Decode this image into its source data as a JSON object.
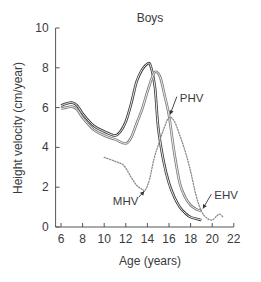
{
  "chart_data": {
    "type": "line",
    "title": "Boys",
    "xlabel": "Age (years)",
    "ylabel": "Height velocity (cm/year)",
    "xlim": [
      5.5,
      22
    ],
    "ylim": [
      0,
      10
    ],
    "x_ticks": [
      6,
      8,
      10,
      12,
      14,
      16,
      18,
      20,
      22
    ],
    "y_ticks": [
      0,
      2,
      4,
      6,
      8,
      10
    ],
    "grid": false,
    "legend": null,
    "series": [
      {
        "name": "Early maturer (dark solid)",
        "style": "solid",
        "color": "#3a3a3a",
        "points": [
          [
            6,
            6.1
          ],
          [
            6.5,
            6.2
          ],
          [
            7,
            6.25
          ],
          [
            7.5,
            6.1
          ],
          [
            8,
            5.7
          ],
          [
            9,
            5.1
          ],
          [
            10,
            4.8
          ],
          [
            11,
            4.6
          ],
          [
            11.5,
            4.8
          ],
          [
            12,
            5.3
          ],
          [
            12.5,
            6.2
          ],
          [
            13,
            7.3
          ],
          [
            13.5,
            7.9
          ],
          [
            14,
            8.2
          ],
          [
            14.3,
            8.1
          ],
          [
            14.7,
            7.0
          ],
          [
            15,
            5.0
          ],
          [
            15.5,
            3.3
          ],
          [
            16,
            2.2
          ],
          [
            16.5,
            1.5
          ],
          [
            17,
            1.0
          ],
          [
            17.5,
            0.7
          ],
          [
            18,
            0.5
          ],
          [
            19,
            0.35
          ]
        ]
      },
      {
        "name": "Late maturer (light solid)",
        "style": "solid",
        "color": "#7a7a7a",
        "points": [
          [
            6,
            5.95
          ],
          [
            6.5,
            6.0
          ],
          [
            7,
            6.05
          ],
          [
            7.5,
            5.9
          ],
          [
            8,
            5.5
          ],
          [
            9,
            4.9
          ],
          [
            10,
            4.6
          ],
          [
            11,
            4.4
          ],
          [
            12,
            4.2
          ],
          [
            12.5,
            4.5
          ],
          [
            13,
            5.2
          ],
          [
            13.5,
            5.9
          ],
          [
            14,
            6.8
          ],
          [
            14.5,
            7.6
          ],
          [
            14.8,
            7.8
          ],
          [
            15.2,
            7.5
          ],
          [
            15.6,
            6.6
          ],
          [
            16,
            5.6
          ],
          [
            16.5,
            3.7
          ],
          [
            17,
            2.2
          ],
          [
            17.5,
            1.5
          ],
          [
            18,
            1.1
          ],
          [
            18.5,
            0.9
          ],
          [
            19,
            0.8
          ]
        ]
      },
      {
        "name": "Velocity difference (dotted)",
        "style": "dotted",
        "color": "#8a8a8a",
        "points": [
          [
            10,
            3.5
          ],
          [
            11,
            3.3
          ],
          [
            11.8,
            3.1
          ],
          [
            12.5,
            2.5
          ],
          [
            13,
            2.1
          ],
          [
            13.5,
            1.9
          ],
          [
            13.8,
            1.85
          ],
          [
            14.2,
            2.4
          ],
          [
            14.6,
            3.4
          ],
          [
            15,
            4.1
          ],
          [
            15.5,
            4.9
          ],
          [
            16,
            5.5
          ],
          [
            16.5,
            5.3
          ],
          [
            17,
            4.6
          ],
          [
            17.5,
            3.8
          ],
          [
            18,
            2.8
          ],
          [
            18.5,
            1.6
          ],
          [
            19,
            0.8
          ],
          [
            19.5,
            0.45
          ],
          [
            20,
            0.35
          ],
          [
            20.4,
            0.55
          ],
          [
            20.7,
            0.65
          ],
          [
            21,
            0.5
          ]
        ]
      }
    ],
    "annotations": [
      {
        "label": "MHV",
        "target": [
          13.8,
          1.85
        ],
        "text_pos": [
          10.8,
          1.1
        ]
      },
      {
        "label": "PHV",
        "target": [
          16.0,
          5.5
        ],
        "text_pos": [
          17.0,
          6.3
        ]
      },
      {
        "label": "EHV",
        "target": [
          19.0,
          0.8
        ],
        "text_pos": [
          20.2,
          1.4
        ]
      }
    ]
  },
  "labels": {
    "title": "Boys",
    "xlabel": "Age (years)",
    "ylabel": "Height velocity (cm/year)",
    "mhv": "MHV",
    "phv": "PHV",
    "ehv": "EHV"
  }
}
